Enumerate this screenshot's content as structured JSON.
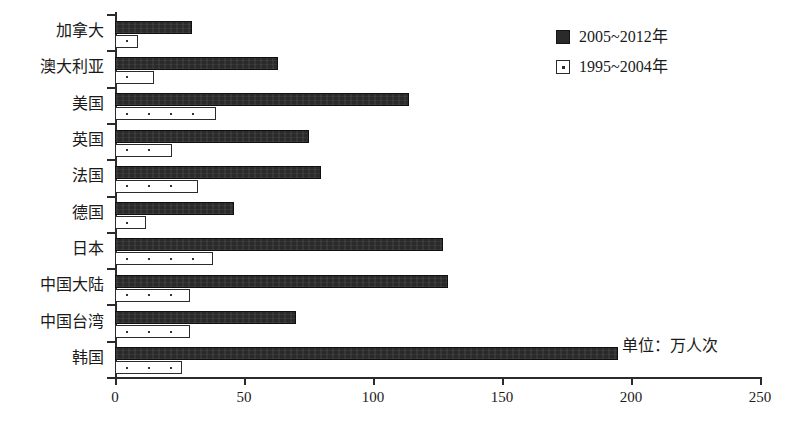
{
  "chart_data": {
    "type": "bar",
    "orientation": "horizontal",
    "title": "",
    "xlabel": "",
    "ylabel": "",
    "xlim": [
      0,
      250
    ],
    "xticks": [
      0,
      50,
      100,
      150,
      200,
      250
    ],
    "grid": false,
    "legend_position": "top-right",
    "annotation": "单位：万人次",
    "categories": [
      "加拿大",
      "澳大利亚",
      "美国",
      "英国",
      "法国",
      "德国",
      "日本",
      "中国大陆",
      "中国台湾",
      "韩国"
    ],
    "series": [
      {
        "name": "2005~2012年",
        "style": "filled-black",
        "values": [
          30,
          63,
          114,
          75,
          80,
          46,
          127,
          129,
          70,
          195
        ]
      },
      {
        "name": "1995~2004年",
        "style": "white-dotted",
        "values": [
          9,
          15,
          39,
          22,
          32,
          12,
          38,
          29,
          29,
          26
        ]
      }
    ]
  },
  "legend": {
    "items": [
      {
        "label": "2005~2012年",
        "swatch": "filled-black-square"
      },
      {
        "label": "1995~2004年",
        "swatch": "white-dotted-square"
      }
    ]
  },
  "axis": {
    "x_tick_labels": [
      "0",
      "50",
      "100",
      "150",
      "200",
      "250"
    ]
  },
  "note": {
    "text": "单位：万人次"
  }
}
